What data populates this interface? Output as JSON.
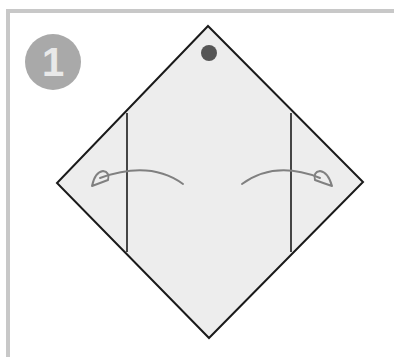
{
  "step": {
    "number": "1"
  },
  "diagram": {
    "type": "origami-fold-instruction",
    "paper": {
      "shape": "diamond",
      "fill": "#ededed",
      "stroke": "#1a1a1a",
      "points": {
        "top": [
          208,
          26
        ],
        "right": [
          363,
          182
        ],
        "bottom": [
          209,
          338
        ],
        "left": [
          57,
          183
        ]
      }
    },
    "marker_dot": {
      "cx": 209,
      "cy": 53,
      "r": 8,
      "color": "#555555"
    },
    "fold_lines": [
      {
        "name": "left-fold-line",
        "x": 127,
        "y1": 113,
        "y2": 252
      },
      {
        "name": "right-fold-line",
        "x": 291,
        "y1": 113,
        "y2": 252
      }
    ],
    "arrows": [
      {
        "name": "left-fold-arrow",
        "direction": "left",
        "color": "#808080"
      },
      {
        "name": "right-fold-arrow",
        "direction": "right",
        "color": "#808080"
      }
    ]
  },
  "colors": {
    "border": "#c8c8c8",
    "badge_bg": "#a9a9a9",
    "badge_text": "#e9e9e9"
  }
}
